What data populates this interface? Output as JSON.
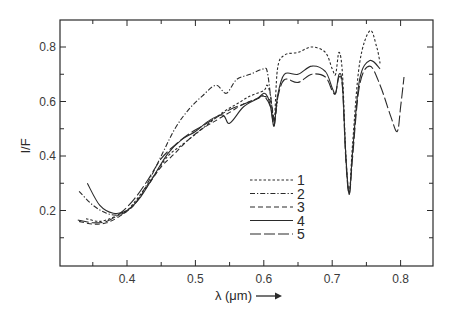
{
  "chart_data": {
    "type": "line",
    "title": "",
    "xlabel": "λ (μm)",
    "ylabel": "I/F",
    "xlim": [
      0.31,
      0.85
    ],
    "ylim": [
      0.0,
      0.9
    ],
    "x_ticks": [
      0.4,
      0.5,
      0.6,
      0.7,
      0.8
    ],
    "x_tick_labels": [
      "0.4",
      "0.5",
      "0.6",
      "0.7",
      "0.8"
    ],
    "y_ticks": [
      0.2,
      0.4,
      0.6,
      0.8
    ],
    "y_tick_labels": [
      "0.2",
      "0.4",
      "0.6",
      "0.8"
    ],
    "grid": false,
    "legend_position": "inside lower-middle",
    "series": [
      {
        "name": "1",
        "style": "dotted",
        "x": [
          0.34,
          0.36,
          0.38,
          0.4,
          0.42,
          0.44,
          0.46,
          0.48,
          0.5,
          0.52,
          0.54,
          0.56,
          0.58,
          0.6,
          0.605,
          0.61,
          0.615,
          0.62,
          0.63,
          0.65,
          0.67,
          0.69,
          0.7,
          0.705,
          0.71,
          0.715,
          0.72,
          0.725,
          0.73,
          0.74,
          0.755,
          0.765,
          0.77
        ],
        "values": [
          0.17,
          0.16,
          0.175,
          0.2,
          0.26,
          0.33,
          0.4,
          0.44,
          0.48,
          0.52,
          0.56,
          0.59,
          0.62,
          0.64,
          0.66,
          0.62,
          0.52,
          0.72,
          0.77,
          0.78,
          0.8,
          0.78,
          0.72,
          0.7,
          0.78,
          0.7,
          0.4,
          0.27,
          0.45,
          0.74,
          0.86,
          0.8,
          0.74
        ]
      },
      {
        "name": "2",
        "style": "dash-dot",
        "x": [
          0.33,
          0.35,
          0.37,
          0.39,
          0.41,
          0.43,
          0.45,
          0.47,
          0.49,
          0.51,
          0.53,
          0.545,
          0.56,
          0.58,
          0.6,
          0.605,
          0.61,
          0.615,
          0.62
        ],
        "values": [
          0.27,
          0.22,
          0.19,
          0.185,
          0.22,
          0.3,
          0.4,
          0.5,
          0.57,
          0.62,
          0.66,
          0.63,
          0.68,
          0.7,
          0.72,
          0.71,
          0.62,
          0.53,
          0.6
        ]
      },
      {
        "name": "3",
        "style": "dashed",
        "x": [
          0.33,
          0.35,
          0.37,
          0.39,
          0.41,
          0.43,
          0.45,
          0.47,
          0.49,
          0.51,
          0.53,
          0.55,
          0.57,
          0.59,
          0.6,
          0.61,
          0.615
        ],
        "values": [
          0.16,
          0.15,
          0.155,
          0.18,
          0.22,
          0.29,
          0.36,
          0.41,
          0.46,
          0.5,
          0.53,
          0.56,
          0.59,
          0.61,
          0.62,
          0.6,
          0.53
        ]
      },
      {
        "name": "4",
        "style": "solid",
        "x": [
          0.342,
          0.36,
          0.38,
          0.4,
          0.42,
          0.44,
          0.46,
          0.48,
          0.5,
          0.52,
          0.54,
          0.55,
          0.57,
          0.59,
          0.6,
          0.605,
          0.61,
          0.615,
          0.62,
          0.63,
          0.65,
          0.67,
          0.69,
          0.7,
          0.705,
          0.71,
          0.715,
          0.72,
          0.725,
          0.73,
          0.74,
          0.755,
          0.77
        ],
        "values": [
          0.3,
          0.22,
          0.19,
          0.2,
          0.25,
          0.33,
          0.41,
          0.46,
          0.49,
          0.53,
          0.55,
          0.52,
          0.58,
          0.61,
          0.63,
          0.62,
          0.58,
          0.51,
          0.62,
          0.7,
          0.7,
          0.73,
          0.71,
          0.65,
          0.63,
          0.7,
          0.66,
          0.4,
          0.26,
          0.42,
          0.68,
          0.75,
          0.72
        ]
      },
      {
        "name": "5",
        "style": "long-dash",
        "x": [
          0.328,
          0.35,
          0.37,
          0.39,
          0.41,
          0.43,
          0.45,
          0.47,
          0.49,
          0.51,
          0.53,
          0.55,
          0.57,
          0.59,
          0.6,
          0.61,
          0.615,
          0.62,
          0.63,
          0.65,
          0.67,
          0.69,
          0.7,
          0.705,
          0.71,
          0.715,
          0.72,
          0.725,
          0.73,
          0.74,
          0.755,
          0.77,
          0.785,
          0.795,
          0.8,
          0.805
        ],
        "values": [
          0.165,
          0.155,
          0.16,
          0.19,
          0.24,
          0.31,
          0.39,
          0.44,
          0.48,
          0.51,
          0.54,
          0.57,
          0.59,
          0.61,
          0.62,
          0.58,
          0.51,
          0.61,
          0.68,
          0.67,
          0.7,
          0.69,
          0.64,
          0.63,
          0.69,
          0.65,
          0.38,
          0.26,
          0.4,
          0.66,
          0.73,
          0.66,
          0.55,
          0.49,
          0.58,
          0.69
        ]
      }
    ]
  },
  "axes": {
    "x_title": "λ (μm)",
    "x_arrow": "→",
    "y_title": "I/F"
  },
  "legend": {
    "items": [
      {
        "label": "1",
        "style": "dotted"
      },
      {
        "label": "2",
        "style": "dash-dot"
      },
      {
        "label": "3",
        "style": "dashed"
      },
      {
        "label": "4",
        "style": "solid"
      },
      {
        "label": "5",
        "style": "long-dash"
      }
    ]
  },
  "colors": {
    "ink": "#2a2a2a",
    "background": "#ffffff"
  }
}
